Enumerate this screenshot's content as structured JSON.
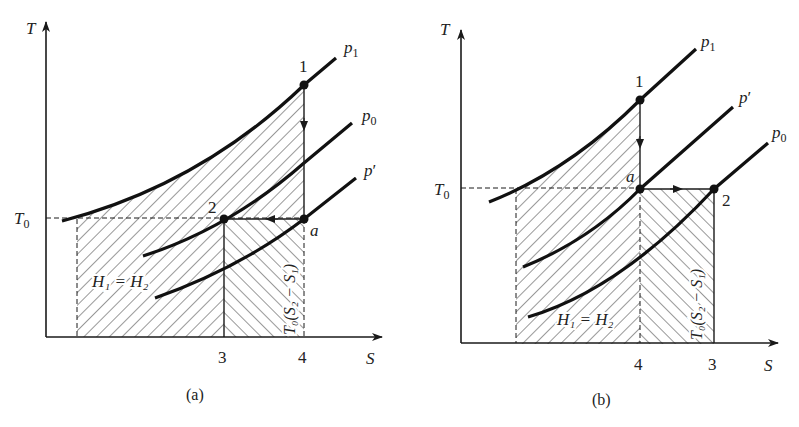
{
  "panels": [
    {
      "id": "a",
      "caption": "(a)",
      "axis_y_label": "T",
      "axis_x_label": "S",
      "t0_label": "T",
      "t0_sub": "0",
      "isobars": [
        {
          "label": "p",
          "sub": "1"
        },
        {
          "label": "p",
          "sub": "0"
        },
        {
          "label": "p",
          "prime": "′"
        }
      ],
      "points": {
        "p1": "1",
        "p2": "2",
        "pa": "a"
      },
      "x_ticks": [
        "3",
        "4"
      ],
      "area_label_left": "H₁ = H₂",
      "area_label_right": "T₀(S₂ − S₁)"
    },
    {
      "id": "b",
      "caption": "(b)",
      "axis_y_label": "T",
      "axis_x_label": "S",
      "t0_label": "T",
      "t0_sub": "0",
      "isobars": [
        {
          "label": "p",
          "sub": "1"
        },
        {
          "label": "p",
          "prime": "′"
        },
        {
          "label": "p",
          "sub": "0"
        }
      ],
      "points": {
        "p1": "1",
        "p2": "2",
        "pa": "a"
      },
      "x_ticks": [
        "4",
        "3"
      ],
      "area_label_left": "H₁ = H₂",
      "area_label_right": "T₀(S₂ − S₁)"
    }
  ],
  "colors": {
    "ink": "#1a1a1a",
    "hatch": "#333333",
    "background": "#ffffff"
  }
}
